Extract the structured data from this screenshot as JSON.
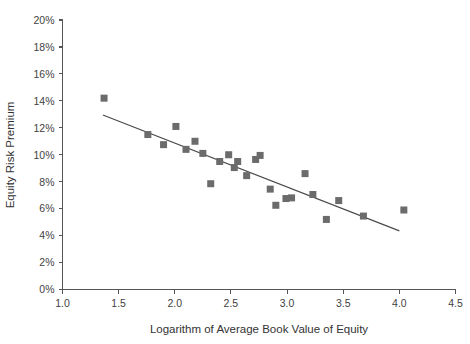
{
  "chart_data": {
    "type": "scatter",
    "title": "",
    "xlabel": "Logarithm of Average Book Value of Equity",
    "ylabel": "Equity Risk Premium",
    "xlim": [
      1.0,
      4.5
    ],
    "ylim": [
      0,
      20
    ],
    "grid": false,
    "legend": null,
    "x_ticks": [
      "1.0",
      "1.5",
      "2.0",
      "2.5",
      "3.0",
      "3.5",
      "4.0",
      "4.5"
    ],
    "x_tick_values": [
      1.0,
      1.5,
      2.0,
      2.5,
      3.0,
      3.5,
      4.0,
      4.5
    ],
    "y_ticks": [
      "0%",
      "2%",
      "4%",
      "6%",
      "8%",
      "10%",
      "12%",
      "14%",
      "16%",
      "18%",
      "20%"
    ],
    "y_tick_values": [
      0,
      2,
      4,
      6,
      8,
      10,
      12,
      14,
      16,
      18,
      20
    ],
    "marker_color": "#6b6b6b",
    "marker_shape": "square",
    "marker_size": 7,
    "line_color": "#4a4a4a",
    "axis_color": "#555555",
    "background_color": "#ffffff",
    "series": [
      {
        "name": "Equity Risk Premium vs Log Book Value",
        "points": [
          {
            "x": 1.37,
            "y": 14.2
          },
          {
            "x": 1.76,
            "y": 11.5
          },
          {
            "x": 1.9,
            "y": 10.75
          },
          {
            "x": 2.01,
            "y": 12.1
          },
          {
            "x": 2.1,
            "y": 10.4
          },
          {
            "x": 2.18,
            "y": 11.0
          },
          {
            "x": 2.25,
            "y": 10.1
          },
          {
            "x": 2.32,
            "y": 7.85
          },
          {
            "x": 2.4,
            "y": 9.5
          },
          {
            "x": 2.48,
            "y": 10.0
          },
          {
            "x": 2.53,
            "y": 9.05
          },
          {
            "x": 2.56,
            "y": 9.5
          },
          {
            "x": 2.64,
            "y": 8.45
          },
          {
            "x": 2.72,
            "y": 9.65
          },
          {
            "x": 2.76,
            "y": 9.95
          },
          {
            "x": 2.85,
            "y": 7.45
          },
          {
            "x": 2.9,
            "y": 6.25
          },
          {
            "x": 2.99,
            "y": 6.75
          },
          {
            "x": 3.04,
            "y": 6.8
          },
          {
            "x": 3.16,
            "y": 8.6
          },
          {
            "x": 3.23,
            "y": 7.05
          },
          {
            "x": 3.35,
            "y": 5.2
          },
          {
            "x": 3.46,
            "y": 6.6
          },
          {
            "x": 3.68,
            "y": 5.45
          },
          {
            "x": 4.04,
            "y": 5.9
          }
        ]
      }
    ],
    "trendline": {
      "name": "linear-fit",
      "x_start": 1.36,
      "y_start": 12.95,
      "x_end": 4.0,
      "y_end": 4.35
    }
  },
  "axis": {
    "x_title": "Logarithm of Average Book Value of Equity",
    "y_title": "Equity Risk Premium"
  }
}
